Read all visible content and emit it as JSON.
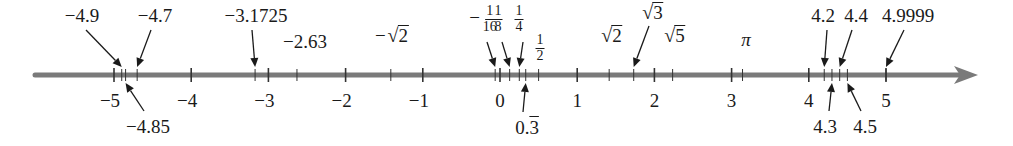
{
  "diagram": {
    "axis": {
      "min": -5,
      "max": 5,
      "px_per_unit": 77.2,
      "zero_x": 500,
      "y": 75,
      "start_x": 35,
      "arrow_tip_x": 978,
      "color": "#7a7a7a"
    },
    "integer_ticks": [
      {
        "value": -5,
        "label": "−5"
      },
      {
        "value": -4,
        "label": "−4"
      },
      {
        "value": -3,
        "label": "−3"
      },
      {
        "value": -2,
        "label": "−2"
      },
      {
        "value": -1,
        "label": "−1"
      },
      {
        "value": 0,
        "label": "0"
      },
      {
        "value": 1,
        "label": "1"
      },
      {
        "value": 2,
        "label": "2"
      },
      {
        "value": 3,
        "label": "3"
      },
      {
        "value": 4,
        "label": "4"
      },
      {
        "value": 5,
        "label": "5"
      }
    ],
    "marked_points": [
      {
        "id": "m4-9",
        "value": -4.9,
        "label": "−4.9",
        "kind": "text",
        "side": "above",
        "arrow": true,
        "label_x": 82,
        "label_y": 6
      },
      {
        "id": "m4-85",
        "value": -4.85,
        "label": "−4.85",
        "kind": "text",
        "side": "below",
        "arrow": true,
        "label_x": 148,
        "label_y": 117
      },
      {
        "id": "m4-7",
        "value": -4.7,
        "label": "−4.7",
        "kind": "text",
        "side": "above",
        "arrow": true,
        "label_x": 155,
        "label_y": 6
      },
      {
        "id": "m3-1725",
        "value": -3.1725,
        "label": "−3.1725",
        "kind": "text",
        "side": "above",
        "arrow": true,
        "label_x": 256,
        "label_y": 6
      },
      {
        "id": "m2-63",
        "value": -2.63,
        "label": "−2.63",
        "kind": "text",
        "side": "above",
        "arrow": false,
        "label_x": 305,
        "label_y": 32
      },
      {
        "id": "msqrt2",
        "value": -1.41421,
        "label": "2",
        "prefix": "−",
        "kind": "sqrt",
        "side": "above",
        "arrow": false,
        "label_x": 392,
        "label_y": 25
      },
      {
        "id": "mfrac16",
        "value": -0.0625,
        "num": "1",
        "den": "16",
        "prefix": "−",
        "kind": "frac",
        "side": "above",
        "arrow": true,
        "label_x": 483,
        "label_y": 4
      },
      {
        "id": "mfrac8",
        "value": 0.125,
        "num": "1",
        "den": "8",
        "kind": "frac",
        "side": "above",
        "arrow": true,
        "label_x": 498,
        "label_y": 4
      },
      {
        "id": "mfrac4",
        "value": 0.25,
        "num": "1",
        "den": "4",
        "kind": "frac",
        "side": "above",
        "arrow": true,
        "label_x": 519,
        "label_y": 4
      },
      {
        "id": "mthird",
        "value": 0.33333,
        "label": "0.3",
        "kind": "repeating",
        "side": "below",
        "arrow": true,
        "label_x": 527,
        "label_y": 118
      },
      {
        "id": "mfrac2",
        "value": 0.5,
        "num": "1",
        "den": "2",
        "kind": "frac",
        "side": "above",
        "arrow": false,
        "label_x": 540,
        "label_y": 33
      },
      {
        "id": "psqrt2",
        "value": 1.41421,
        "label": "2",
        "kind": "sqrt",
        "side": "above",
        "arrow": false,
        "label_x": 612,
        "label_y": 25
      },
      {
        "id": "psqrt3",
        "value": 1.73205,
        "label": "3",
        "kind": "sqrt",
        "side": "above",
        "arrow": true,
        "label_x": 653,
        "label_y": 2
      },
      {
        "id": "psqrt5",
        "value": 2.23607,
        "label": "5",
        "kind": "sqrt",
        "side": "above",
        "arrow": false,
        "label_x": 675,
        "label_y": 25
      },
      {
        "id": "ppi",
        "value": 3.14159,
        "label": "π",
        "kind": "italic",
        "side": "above",
        "arrow": false,
        "label_x": 746,
        "label_y": 30
      },
      {
        "id": "p4-2",
        "value": 4.2,
        "label": "4.2",
        "kind": "text",
        "side": "above",
        "arrow": true,
        "label_x": 823,
        "label_y": 6
      },
      {
        "id": "p4-3",
        "value": 4.3,
        "label": "4.3",
        "kind": "text",
        "side": "below",
        "arrow": true,
        "label_x": 825,
        "label_y": 117
      },
      {
        "id": "p4-4",
        "value": 4.4,
        "label": "4.4",
        "kind": "text",
        "side": "above",
        "arrow": true,
        "label_x": 856,
        "label_y": 6
      },
      {
        "id": "p4-5",
        "value": 4.5,
        "label": "4.5",
        "kind": "text",
        "side": "below",
        "arrow": true,
        "label_x": 865,
        "label_y": 117
      },
      {
        "id": "p4-9999",
        "value": 4.9999,
        "label": "4.9999",
        "kind": "text",
        "side": "above",
        "arrow": true,
        "label_x": 908,
        "label_y": 6
      }
    ],
    "colors": {
      "axis": "#7a7a7a",
      "ticks": "#333333",
      "text": "#1a1a1a",
      "arrows": "#1a1a1a",
      "background": "#ffffff"
    }
  }
}
